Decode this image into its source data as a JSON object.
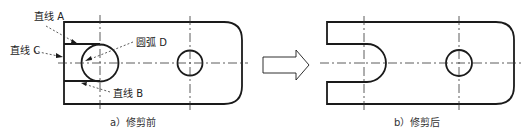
{
  "figure_a": {
    "caption": "a）修剪前",
    "labels": {
      "line_a": "直线 A",
      "line_b": "直线 B",
      "line_c": "直线 C",
      "arc_d": "圆弧 D"
    }
  },
  "figure_b": {
    "caption": "b）修剪后"
  },
  "arrow": "transition-arrow",
  "colors": {
    "stroke": "#1a1a1a",
    "background": "#ffffff"
  }
}
